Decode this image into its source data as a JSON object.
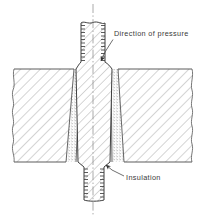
{
  "figure": {
    "type": "engineering-cross-section",
    "background_color": "#ffffff",
    "line_color": "#444444",
    "hatch_color": "#9a9a9a",
    "stipple_color": "#8c8c8c"
  },
  "labels": {
    "pressure": "Direction of pressure",
    "insulation": "Insulation"
  },
  "annotations": [
    {
      "name": "direction-of-pressure",
      "text": "Direction of pressure",
      "text_x": 114,
      "text_y": 36,
      "leader": "M112,39 L104,52 L100,62",
      "arrow_x": 100,
      "arrow_y": 63
    },
    {
      "name": "insulation",
      "text": "Insulation",
      "text_x": 126,
      "text_y": 180,
      "leader": "M124,177 L112,170 L105,164",
      "arrow_x": 104,
      "arrow_y": 163
    }
  ],
  "parts": [
    {
      "name": "bolt",
      "description": "Tapered threaded bolt, conical shoulder, vertical axis",
      "fill": "hatch",
      "threads_top": true,
      "threads_bottom": true
    },
    {
      "name": "left-plate",
      "description": "Sectioned plate body on the left with break lines",
      "fill": "hatch"
    },
    {
      "name": "right-plate",
      "description": "Sectioned plate body on the right with break lines",
      "fill": "hatch"
    },
    {
      "name": "insulation-sleeve-left",
      "description": "Stippled insulating sleeve between bolt and left plate",
      "fill": "stipple"
    },
    {
      "name": "insulation-sleeve-right",
      "description": "Stippled insulating sleeve between bolt and right plate",
      "fill": "stipple"
    },
    {
      "name": "centerline",
      "description": "Dash-dot axis of symmetry",
      "style": "dash-dot"
    }
  ],
  "geometry": {
    "centerline_x": 93,
    "plate_top_y": 68,
    "plate_bottom_y": 163,
    "bolt_top_y": 22,
    "bolt_bottom_y": 201,
    "shank_half_width_top": 12,
    "cone_half_width": 20
  }
}
